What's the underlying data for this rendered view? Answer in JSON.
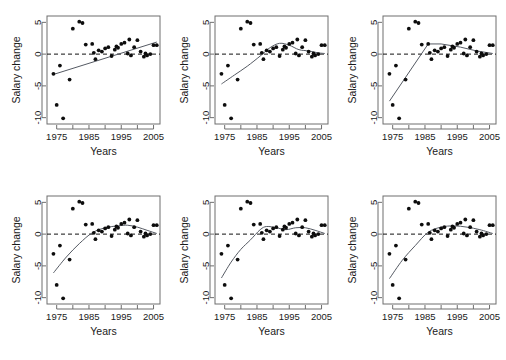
{
  "figure": {
    "panel_count": 6,
    "rows": 2,
    "cols": 3,
    "background": "#ffffff",
    "point_color": "#0d0d0d",
    "line_color": "#555a63",
    "zero_line_color": "#111111"
  },
  "chart_data": {
    "type": "scatter",
    "title": "",
    "xlabel": "Years",
    "ylabel": "Salary change",
    "xlim": [
      1972,
      2007
    ],
    "ylim": [
      -11,
      6
    ],
    "grid": false,
    "legend": false,
    "xticks": [
      1975,
      1985,
      1995,
      2005
    ],
    "xtick_labels": [
      "1975",
      "1985",
      "1995",
      "2005"
    ],
    "xminor_ticks": [
      1975,
      1980,
      1985,
      1990,
      1995,
      2000,
      2005
    ],
    "yticks": [
      5,
      0,
      -5,
      -10
    ],
    "ytick_labels": [
      "5",
      "0",
      "-5",
      "-10"
    ],
    "reference_line": 0,
    "x": [
      1974,
      1975,
      1976,
      1977,
      1979,
      1980,
      1982,
      1983,
      1984,
      1986,
      1986.5,
      1987,
      1988,
      1989,
      1990,
      1991,
      1992,
      1993,
      1993.5,
      1994,
      1995,
      1996,
      1997,
      1997.5,
      1998,
      1999,
      2000,
      2001,
      2002,
      2002.5,
      2003,
      2004,
      2005,
      2006
    ],
    "y": [
      -3.1,
      -8.0,
      -1.8,
      -10.1,
      -4.0,
      4.0,
      5.1,
      4.9,
      1.5,
      1.6,
      0.2,
      -0.8,
      0.6,
      0.4,
      0.9,
      1.1,
      -0.3,
      0.7,
      1.2,
      1.0,
      1.6,
      1.8,
      0.1,
      2.3,
      -0.2,
      1.1,
      2.2,
      0.4,
      -0.4,
      0.1,
      -0.2,
      0.0,
      1.4,
      1.4
    ],
    "series": [
      {
        "name": "panel-1-linear-fit",
        "panel": 1,
        "fit_type": "linear",
        "fit_x": [
          1974,
          2006
        ],
        "fit_y": [
          -3.2,
          1.9
        ]
      },
      {
        "name": "panel-2-spline-fit",
        "panel": 2,
        "fit_type": "smoothing-spline",
        "fit_x": [
          1974,
          1978,
          1982,
          1986,
          1989,
          1992,
          1995,
          1998,
          2001,
          2004,
          2006
        ],
        "fit_y": [
          -4.7,
          -3.3,
          -1.9,
          -0.3,
          1.0,
          1.7,
          1.4,
          0.7,
          0.5,
          0.2,
          0.1
        ]
      },
      {
        "name": "panel-3-broken-stick-fit",
        "panel": 3,
        "fit_type": "piecewise-linear",
        "fit_x": [
          1974,
          1986,
          1990,
          1996,
          2001,
          2006
        ],
        "fit_y": [
          -7.4,
          1.6,
          1.6,
          1.1,
          0.5,
          0.1
        ]
      },
      {
        "name": "panel-4-loess-fit",
        "panel": 4,
        "fit_type": "loess",
        "fit_x": [
          1974,
          1978,
          1982,
          1986,
          1990,
          1994,
          1997,
          2000,
          2003,
          2006
        ],
        "fit_y": [
          -6.1,
          -3.6,
          -1.5,
          0.2,
          1.0,
          1.3,
          1.4,
          1.1,
          0.6,
          0.1
        ]
      },
      {
        "name": "panel-5-smoother-fit",
        "panel": 5,
        "fit_type": "smoothing-spline",
        "fit_x": [
          1974,
          1977,
          1980,
          1983,
          1986,
          1988,
          1991,
          1994,
          1997,
          2000,
          2003,
          2006
        ],
        "fit_y": [
          -6.9,
          -4.4,
          -2.4,
          -0.9,
          0.7,
          1.2,
          1.0,
          0.7,
          1.0,
          1.0,
          0.6,
          0.1
        ]
      },
      {
        "name": "panel-6-quadratic-fit",
        "panel": 6,
        "fit_type": "smooth-curve",
        "fit_x": [
          1974,
          1978,
          1982,
          1986,
          1990,
          1994,
          1998,
          2002,
          2006
        ],
        "fit_y": [
          -7.0,
          -4.1,
          -1.8,
          0.3,
          1.1,
          1.3,
          1.1,
          0.7,
          0.1
        ]
      }
    ]
  },
  "panels": [
    {
      "id": 1,
      "xlabel": "Years",
      "ylabel": "Salary change"
    },
    {
      "id": 2,
      "xlabel": "Years",
      "ylabel": "Salary change"
    },
    {
      "id": 3,
      "xlabel": "Years",
      "ylabel": "Salary change"
    },
    {
      "id": 4,
      "xlabel": "Years",
      "ylabel": "Salary change"
    },
    {
      "id": 5,
      "xlabel": "Years",
      "ylabel": "Salary change"
    },
    {
      "id": 6,
      "xlabel": "Years",
      "ylabel": "Salary change"
    }
  ]
}
